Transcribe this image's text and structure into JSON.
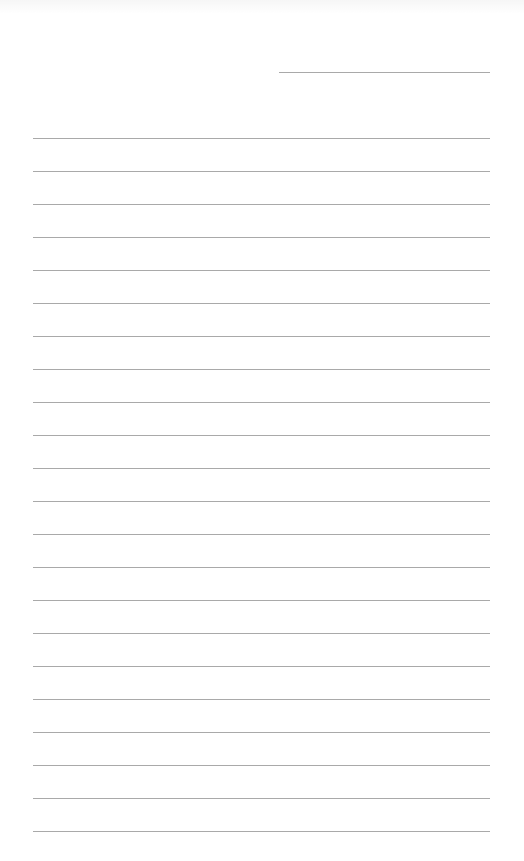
{
  "page": {
    "type": "lined-writing-paper",
    "background_color": "#ffffff",
    "line_color": "#a9a9a9",
    "header_line": {
      "x_start": 279,
      "x_end": 490,
      "y": 72
    },
    "ruled_lines": {
      "count": 22,
      "x_start": 33,
      "x_end": 490,
      "first_y": 138,
      "spacing": 33
    },
    "text_content": []
  }
}
